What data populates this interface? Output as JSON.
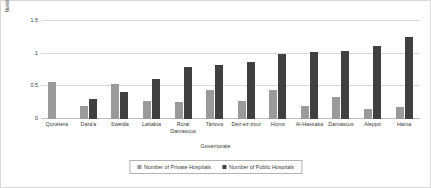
{
  "chart_data": {
    "type": "bar",
    "title": "",
    "subtitle": "",
    "xlabel": "Governorate",
    "ylabel": "Number of Hospitals per 50,000 people",
    "ylim": [
      0,
      1.5
    ],
    "yticks": [
      "0",
      "0.5",
      "1",
      "1.5"
    ],
    "ytick_values": [
      0,
      0.5,
      1,
      1.5
    ],
    "grid": true,
    "legend_position": "bottom",
    "categories": [
      "Qunetera",
      "Dara'a",
      "Sweida",
      "Lattakia",
      "Rural Damascus",
      "Tartous",
      "Deir-ez-zour",
      "Homs",
      "Al-Hassaka",
      "Damascus",
      "Aleppo",
      "Hama"
    ],
    "series": [
      {
        "name": "Number of Private Hospitals",
        "color": "#9a9a9a",
        "values": [
          0.57,
          0.2,
          0.54,
          0.27,
          0.26,
          0.45,
          0.28,
          0.45,
          0.2,
          0.34,
          0.16,
          0.19
        ]
      },
      {
        "name": "Number of Public Hospitals",
        "color": "#404040",
        "values": [
          0.0,
          0.3,
          0.41,
          0.62,
          0.79,
          0.83,
          0.88,
          0.99,
          1.02,
          1.04,
          1.11,
          1.25
        ]
      }
    ]
  },
  "colors": {
    "private": "#9a9a9a",
    "public": "#404040",
    "gridline": "#d9d9d9",
    "axis": "#bfbfbf",
    "text": "#3a3a3a",
    "border": "#d9d9d9",
    "legend_border": "#b3b3b3",
    "background": "#ffffff"
  }
}
